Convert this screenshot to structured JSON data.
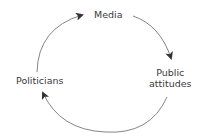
{
  "diagram": {
    "type": "cycle",
    "nodes": [
      {
        "id": "media",
        "label": "Media"
      },
      {
        "id": "public",
        "label_line1": "Public",
        "label_line2": "attitudes"
      },
      {
        "id": "politicians",
        "label": "Politicians"
      }
    ],
    "edges": [
      {
        "from": "media",
        "to": "public"
      },
      {
        "from": "public",
        "to": "politicians"
      },
      {
        "from": "politicians",
        "to": "media"
      }
    ],
    "colors": {
      "line": "#555555",
      "text": "#3a3a3a"
    }
  }
}
